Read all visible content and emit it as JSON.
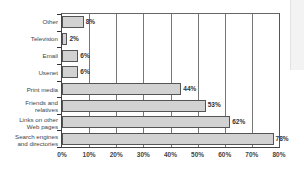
{
  "chart_data": {
    "type": "bar",
    "orientation": "horizontal",
    "title": "",
    "xlabel": "",
    "ylabel": "",
    "categories": [
      "Other",
      "Television",
      "Email",
      "Usenet",
      "Print media",
      "Friends and relatives",
      "Links on other Web pages",
      "Search engines and directories"
    ],
    "values": [
      8,
      2,
      6,
      6,
      44,
      53,
      62,
      78
    ],
    "value_labels": [
      "8%",
      "2%",
      "6%",
      "6%",
      "44%",
      "53%",
      "62%",
      "78%"
    ],
    "xlim": [
      0,
      80
    ],
    "xticks": [
      "0%",
      "10%",
      "20%",
      "30%",
      "40%",
      "50%",
      "60%",
      "70%",
      "80%"
    ],
    "grid": "vertical",
    "legend": "none",
    "bar_color": "#d2d2d2"
  },
  "labels": {
    "cat0_l1": "Other",
    "cat1_l1": "Television",
    "cat2_l1": "Email",
    "cat3_l1": "Usenet",
    "cat4_l1": "Print media",
    "cat5_l1": "Friends and",
    "cat5_l2": "relatives",
    "cat6_l1": "Links on other",
    "cat6_l2": "Web pages",
    "cat7_l1": "Search engines",
    "cat7_l2": "and directories"
  }
}
